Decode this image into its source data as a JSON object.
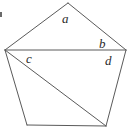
{
  "figure": {
    "name": "pentagon-with-diagonals",
    "background_color": "#ffffff",
    "stroke_color": "#5a5a5a",
    "label_color": "#2b2b2b",
    "stroke_width": 1,
    "width": 133,
    "height": 132,
    "vertices": [
      {
        "id": "V1",
        "name": "left-vertex",
        "x": 5,
        "y": 50
      },
      {
        "id": "V2",
        "name": "apex-vertex",
        "x": 68,
        "y": 3
      },
      {
        "id": "V3",
        "name": "right-vertex",
        "x": 126,
        "y": 50
      },
      {
        "id": "V4",
        "name": "bottom-right-vertex",
        "x": 106,
        "y": 126
      },
      {
        "id": "V5",
        "name": "bottom-left-vertex",
        "x": 27,
        "y": 125
      }
    ],
    "edges": [
      {
        "name": "edge-left-upper",
        "from": "V1",
        "to": "V2"
      },
      {
        "name": "edge-right-upper",
        "from": "V2",
        "to": "V3"
      },
      {
        "name": "edge-right-lower",
        "from": "V3",
        "to": "V4"
      },
      {
        "name": "edge-bottom",
        "from": "V4",
        "to": "V5"
      },
      {
        "name": "edge-left-lower",
        "from": "V5",
        "to": "V1"
      }
    ],
    "diagonals": [
      {
        "name": "diagonal-left-to-right",
        "from": "V1",
        "to": "V3"
      },
      {
        "name": "diagonal-left-to-bottom-right",
        "from": "V1",
        "to": "V4"
      }
    ],
    "labels": [
      {
        "id": "a",
        "text": "a",
        "name": "angle-label-a",
        "x": 62,
        "y": 12,
        "region": "top-triangle"
      },
      {
        "id": "b",
        "text": "b",
        "name": "angle-label-b",
        "x": 99,
        "y": 37,
        "region": "top-triangle-right-corner"
      },
      {
        "id": "c",
        "text": "c",
        "name": "angle-label-c",
        "x": 26,
        "y": 52,
        "region": "middle-triangle-left-corner"
      },
      {
        "id": "d",
        "text": "d",
        "name": "angle-label-d",
        "x": 105,
        "y": 54,
        "region": "middle-triangle-right-corner"
      }
    ],
    "corner_mark": {
      "name": "corner-tick-mark",
      "x": 0,
      "y": 12,
      "width": 2,
      "height": 5
    }
  }
}
